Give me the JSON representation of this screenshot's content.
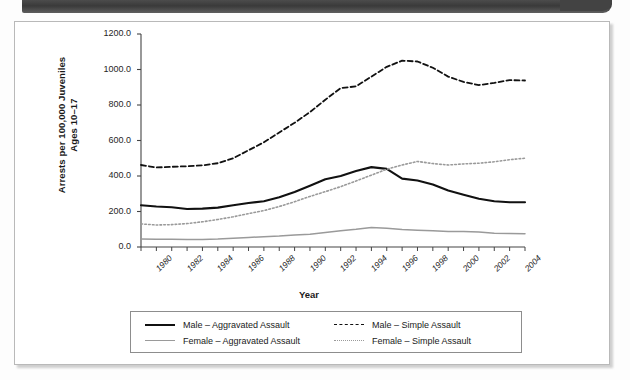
{
  "page": {
    "artifact_top_bar": "scanned-page-dark-bar",
    "panel_background": "#ffffff"
  },
  "chart_data": {
    "type": "line",
    "title": "",
    "xlabel": "Year",
    "ylabel": "Arrests per 100,000 Juveniles Ages 10–17",
    "ylabel_line1": "Arrests per 100,000 Juveniles",
    "ylabel_line2": "Ages 10–17",
    "ylim": [
      0,
      1200
    ],
    "yticks": [
      0,
      200,
      400,
      600,
      800,
      1000,
      1200
    ],
    "ytick_labels": [
      "0.0",
      "200.0",
      "400.0",
      "600.0",
      "800.0",
      "1000.0",
      "1200.0"
    ],
    "xlim": [
      1980,
      2005
    ],
    "x": [
      1980,
      1981,
      1982,
      1983,
      1984,
      1985,
      1986,
      1987,
      1988,
      1989,
      1990,
      1991,
      1992,
      1993,
      1994,
      1995,
      1996,
      1997,
      1998,
      1999,
      2000,
      2001,
      2002,
      2003,
      2004,
      2005
    ],
    "xticks": [
      1980,
      1981,
      1982,
      1983,
      1984,
      1985,
      1986,
      1987,
      1988,
      1989,
      1990,
      1991,
      1992,
      1993,
      1994,
      1995,
      1996,
      1997,
      1998,
      1999,
      2000,
      2001,
      2002,
      2003,
      2004,
      2005
    ],
    "xtick_labels": [
      "1980",
      "1982",
      "1984",
      "1986",
      "1988",
      "1990",
      "1992",
      "1994",
      "1996",
      "1998",
      "2000",
      "2002",
      "2004"
    ],
    "xtick_label_values": [
      1980,
      1982,
      1984,
      1986,
      1988,
      1990,
      1992,
      1994,
      1996,
      1998,
      2000,
      2002,
      2004
    ],
    "grid": false,
    "legend_position": "bottom",
    "series": [
      {
        "name": "Male – Aggravated Assault",
        "style": "solid",
        "color": "#111111",
        "width": 2.1,
        "values": [
          235,
          228,
          224,
          214,
          216,
          222,
          235,
          248,
          258,
          280,
          310,
          345,
          382,
          400,
          428,
          450,
          440,
          385,
          375,
          352,
          318,
          295,
          272,
          258,
          252,
          252
        ]
      },
      {
        "name": "Male – Simple Assault",
        "style": "dashed",
        "color": "#111111",
        "width": 1.8,
        "values": [
          462,
          448,
          452,
          455,
          460,
          472,
          500,
          545,
          590,
          645,
          700,
          760,
          830,
          895,
          905,
          960,
          1015,
          1050,
          1045,
          1010,
          960,
          930,
          912,
          925,
          940,
          938
        ]
      },
      {
        "name": "Female – Aggravated Assault",
        "style": "solid",
        "color": "#9a9a9a",
        "width": 1.5,
        "values": [
          45,
          44,
          44,
          42,
          42,
          45,
          50,
          54,
          58,
          62,
          68,
          72,
          82,
          92,
          100,
          110,
          105,
          98,
          95,
          92,
          88,
          88,
          84,
          78,
          76,
          75
        ]
      },
      {
        "name": "Female – Simple Assault",
        "style": "dotted",
        "color": "#9a9a9a",
        "width": 1.6,
        "values": [
          130,
          124,
          126,
          132,
          142,
          155,
          170,
          188,
          205,
          228,
          255,
          285,
          312,
          340,
          372,
          405,
          438,
          462,
          482,
          470,
          462,
          468,
          472,
          480,
          492,
          500
        ]
      }
    ]
  },
  "legend": {
    "items": [
      {
        "label": "Male – Aggravated Assault",
        "swatch": "solid-dark-line"
      },
      {
        "label": "Male – Simple Assault",
        "swatch": "dashed-dark-line"
      },
      {
        "label": "Female – Aggravated Assault",
        "swatch": "solid-gray-line"
      },
      {
        "label": "Female – Simple Assault",
        "swatch": "dotted-gray-line"
      }
    ]
  }
}
